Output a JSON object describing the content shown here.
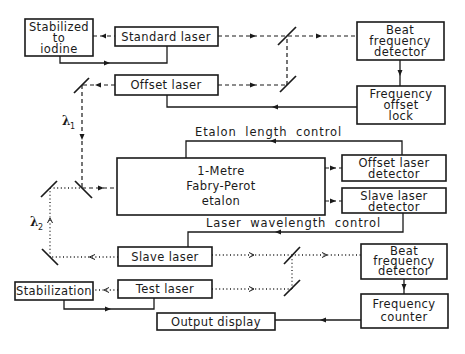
{
  "diagram": {
    "type": "block-diagram",
    "legend": {
      "dashed_line": "lambda1 beam path",
      "dotted_line": "lambda2 beam path",
      "solid_line": "electrical / control signal"
    },
    "beam_labels": {
      "lambda1": "λ",
      "lambda1_sub": "1",
      "lambda2": "λ",
      "lambda2_sub": "2"
    },
    "control_labels": {
      "etalon_length": "Etalon length control",
      "laser_wavelength": "Laser wavelength control"
    },
    "blocks": {
      "stabilized_iodine": {
        "lines": [
          "Stabilized",
          "to",
          "iodine"
        ]
      },
      "standard_laser": {
        "lines": [
          "Standard laser"
        ]
      },
      "beat_detector_top": {
        "lines": [
          "Beat",
          "frequency",
          "detector"
        ]
      },
      "offset_laser": {
        "lines": [
          "Offset laser"
        ]
      },
      "freq_offset_lock": {
        "lines": [
          "Frequency",
          "offset",
          "lock"
        ]
      },
      "etalon": {
        "lines": [
          "1-Metre",
          "Fabry-Perot",
          "etalon"
        ]
      },
      "offset_laser_detector": {
        "lines": [
          "Offset laser",
          "detector"
        ]
      },
      "slave_laser_detector": {
        "lines": [
          "Slave laser",
          "detector"
        ]
      },
      "slave_laser": {
        "lines": [
          "Slave laser"
        ]
      },
      "beat_detector_bottom": {
        "lines": [
          "Beat",
          "frequency",
          "detector"
        ]
      },
      "stabilization": {
        "lines": [
          "Stabilization"
        ]
      },
      "test_laser": {
        "lines": [
          "Test laser"
        ]
      },
      "frequency_counter": {
        "lines": [
          "Frequency",
          "counter"
        ]
      },
      "output_display": {
        "lines": [
          "Output display"
        ]
      }
    },
    "connections": [
      {
        "from": "Standard laser",
        "to": "Stabilized to iodine",
        "style": "dashed"
      },
      {
        "from": "Stabilized to iodine",
        "to": "Standard laser",
        "style": "solid"
      },
      {
        "from": "Standard laser",
        "to": "Beat frequency detector (top)",
        "style": "dashed",
        "via": "beam splitter"
      },
      {
        "from": "Offset laser",
        "to": "Beat frequency detector (top)",
        "style": "dashed",
        "via": "mirror"
      },
      {
        "from": "Beat frequency detector (top)",
        "to": "Frequency offset lock",
        "style": "solid"
      },
      {
        "from": "Frequency offset lock",
        "to": "Offset laser",
        "style": "solid"
      },
      {
        "from": "Offset laser",
        "to": "1-Metre Fabry-Perot etalon",
        "style": "dashed",
        "label": "λ1"
      },
      {
        "from": "Slave laser",
        "to": "1-Metre Fabry-Perot etalon",
        "style": "dotted",
        "label": "λ2"
      },
      {
        "from": "1-Metre Fabry-Perot etalon",
        "to": "Offset laser detector",
        "style": "dashed"
      },
      {
        "from": "1-Metre Fabry-Perot etalon",
        "to": "Slave laser detector",
        "style": "dashed"
      },
      {
        "from": "Offset laser detector",
        "to": "1-Metre Fabry-Perot etalon",
        "style": "solid",
        "label": "Etalon length control"
      },
      {
        "from": "Slave laser detector",
        "to": "Slave laser",
        "style": "solid",
        "label": "Laser wavelength control"
      },
      {
        "from": "Slave laser",
        "to": "Beat frequency detector (bottom)",
        "style": "dotted",
        "via": "beam splitter"
      },
      {
        "from": "Test laser",
        "to": "Beat frequency detector (bottom)",
        "style": "dotted",
        "via": "mirror"
      },
      {
        "from": "Test laser",
        "to": "Stabilization",
        "style": "dotted"
      },
      {
        "from": "Stabilization",
        "to": "Test laser",
        "style": "solid"
      },
      {
        "from": "Beat frequency detector (bottom)",
        "to": "Frequency counter",
        "style": "solid"
      },
      {
        "from": "Frequency counter",
        "to": "Output display",
        "style": "solid"
      }
    ]
  }
}
